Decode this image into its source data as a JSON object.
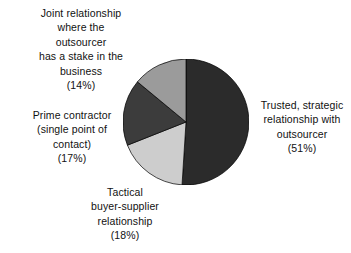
{
  "chart_data": {
    "type": "pie",
    "title": "",
    "subtitle": "",
    "xlabel": "",
    "ylabel": "",
    "legend_position": "none",
    "grid": false,
    "start_angle_deg": 0,
    "direction": "clockwise",
    "categories": [
      "Trusted, strategic relationship with outsourcer",
      "Tactical buyer-supplier relationship",
      "Prime contractor (single point of contact)",
      "Joint relationship where the outsourcer has a stake in the business"
    ],
    "values": [
      51,
      18,
      17,
      14
    ],
    "value_unit": "%",
    "colors": [
      "#2b2b2b",
      "#cdcdcd",
      "#3c3c3c",
      "#9b9b9b"
    ],
    "slices": [
      {
        "label": "Trusted, strategic relationship with outsourcer",
        "value": 51,
        "value_text": "(51%)",
        "color": "#2b2b2b",
        "start_deg": 0,
        "end_deg": 183.6
      },
      {
        "label": "Tactical buyer-supplier relationship",
        "value": 18,
        "value_text": "(18%)",
        "color": "#cdcdcd",
        "start_deg": 183.6,
        "end_deg": 248.4
      },
      {
        "label": "Prime contractor (single point of contact)",
        "value": 17,
        "value_text": "(17%)",
        "color": "#3c3c3c",
        "start_deg": 248.4,
        "end_deg": 309.6
      },
      {
        "label": "Joint relationship where the outsourcer has a stake in the business",
        "value": 14,
        "value_text": "(14%)",
        "color": "#9b9b9b",
        "start_deg": 309.6,
        "end_deg": 360
      }
    ]
  },
  "labels": {
    "joint": "Joint relationship\nwhere the\noutsourcer\nhas a stake in the\nbusiness\n(14%)",
    "prime": "Prime contractor\n(single point of\ncontact)\n(17%)",
    "tactical": "Tactical\nbuyer-supplier\nrelationship\n(18%)",
    "trusted": "Trusted, strategic\nrelationship with\noutsourcer\n(51%)"
  },
  "style": {
    "background": "#ffffff",
    "text_color": "#111111",
    "slice_outline": "#000000"
  }
}
